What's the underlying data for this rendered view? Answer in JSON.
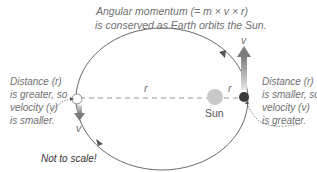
{
  "title": {
    "line1": "Angular momentum (= m × v × r)",
    "line2": "is conserved as Earth orbits the Sun."
  },
  "left_annotation": {
    "lines": [
      "Distance (r)",
      "is greater, so",
      "velocity (v)",
      "is smaller."
    ]
  },
  "right_annotation": {
    "lines": [
      "Distance (r)",
      "is smaller, so",
      "velocity (v)",
      "is greater."
    ]
  },
  "labels": {
    "r_far": "r",
    "r_near": "r",
    "v_near": "v",
    "v_far": "v",
    "sun": "Sun",
    "note": "Not to scale!"
  },
  "colors": {
    "orbit": "#6a6a6a",
    "dash": "#9a9a9a",
    "sun": "#c8c8c8",
    "earth": "#3a3a3a",
    "text": "#6f6f6f",
    "arrow_dark": "#7a7a7a",
    "arrow_light": "#d8d8d8"
  }
}
